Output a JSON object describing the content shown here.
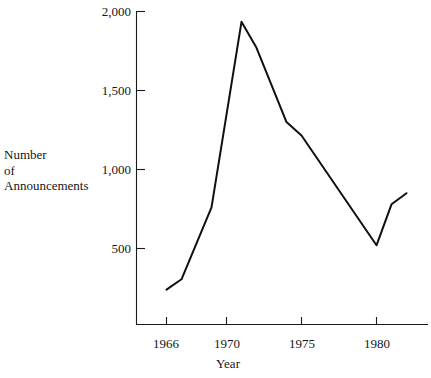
{
  "chart_data": {
    "type": "line",
    "title": "",
    "xlabel": "Year",
    "ylabel": "Number of Announcements",
    "ylabel_lines": [
      "Number",
      "of",
      "Announcements"
    ],
    "x": [
      1966,
      1967,
      1969,
      1971,
      1972,
      1974,
      1975,
      1980,
      1981,
      1982
    ],
    "values": [
      240,
      305,
      760,
      1935,
      1770,
      1300,
      1215,
      520,
      780,
      850
    ],
    "series": [
      {
        "name": "Number of Announcements",
        "points": [
          {
            "year": 1966,
            "value": 240
          },
          {
            "year": 1967,
            "value": 305
          },
          {
            "year": 1969,
            "value": 760
          },
          {
            "year": 1971,
            "value": 1935
          },
          {
            "year": 1972,
            "value": 1770
          },
          {
            "year": 1974,
            "value": 1300
          },
          {
            "year": 1975,
            "value": 1215
          },
          {
            "year": 1980,
            "value": 520
          },
          {
            "year": 1981,
            "value": 780
          },
          {
            "year": 1982,
            "value": 850
          }
        ]
      }
    ],
    "xlim": [
      1965.2,
      1982.6
    ],
    "ylim": [
      0,
      2050
    ],
    "xticks": [
      1966,
      1970,
      1975,
      1980
    ],
    "xtick_labels": [
      "1966",
      "1970",
      "1975",
      "1980"
    ],
    "yticks": [
      500,
      1000,
      1500,
      2000
    ],
    "ytick_labels": [
      "500",
      "1,000",
      "1,500",
      "2,000"
    ],
    "grid": false,
    "legend": null,
    "line_color": "#101010",
    "background_color": "#ffffff"
  },
  "axis": {
    "y_title_line1": "Number",
    "y_title_line2": "of",
    "y_title_line3": "Announcements",
    "x_title": "Year"
  },
  "ytick_labels": {
    "t0": "500",
    "t1": "1,000",
    "t2": "1,500",
    "t3": "2,000"
  },
  "xtick_labels": {
    "t0": "1966",
    "t1": "1970",
    "t2": "1975",
    "t3": "1980"
  }
}
